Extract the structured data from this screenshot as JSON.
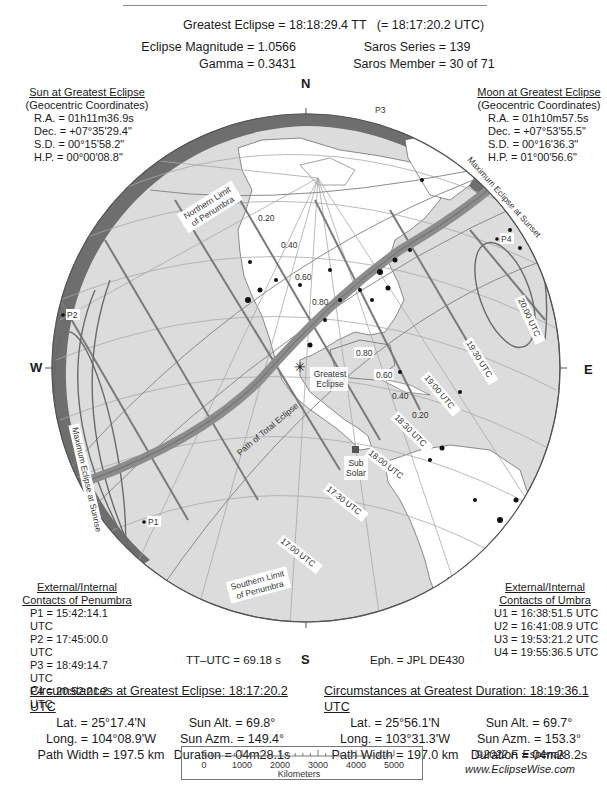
{
  "header": {
    "greatest_eclipse_label": "Greatest Eclipse =",
    "greatest_eclipse_tt": "18:18:29.4 TT",
    "greatest_eclipse_utc": "(= 18:17:20.2 UTC)",
    "magnitude_label": "Eclipse Magnitude =",
    "magnitude_value": "1.0566",
    "gamma_label": "Gamma =",
    "gamma_value": "0.3431",
    "saros_series_label": "Saros Series =",
    "saros_series_value": "139",
    "saros_member_label": "Saros Member =",
    "saros_member_value": "30 of 71"
  },
  "sun_panel": {
    "title": "Sun at Greatest Eclipse",
    "subtitle": "(Geocentric Coordinates)",
    "rows": [
      "R.A. = 01h11m36.9s",
      "Dec. = +07°35'29.4\"",
      "S.D. =  00°15'58.2\"",
      "H.P. =  00°00'08.8\""
    ]
  },
  "moon_panel": {
    "title": "Moon at Greatest Eclipse",
    "subtitle": "(Geocentric Coordinates)",
    "rows": [
      "R.A. = 01h10m57.5s",
      "Dec. = +07°53'55.5\"",
      "S.D. =  00°16'36.3\"",
      "H.P. =  01°00'56.6\""
    ]
  },
  "penumbra_contacts": {
    "title1": "External/Internal",
    "title2": "Contacts of Penumbra",
    "rows": [
      "P1 = 15:42:14.1 UTC",
      "P2 = 17:45:00.0 UTC",
      "P3 = 18:49:14.7 UTC",
      "P4 = 20:52:21.2 UTC"
    ]
  },
  "umbra_contacts": {
    "title1": "External/Internal",
    "title2": "Contacts of Umbra",
    "rows": [
      "U1 = 16:38:51.5 UTC",
      "U2 = 16:41:08.9 UTC",
      "U3 = 19:53:21.2 UTC",
      "U4 = 19:55:36.5 UTC"
    ]
  },
  "compass": {
    "n": "N",
    "s": "S",
    "e": "E",
    "w": "W"
  },
  "misc": {
    "tt_utc": "TT–UTC =  69.18 s",
    "ephemeris": "Eph. = JPL DE430"
  },
  "map": {
    "labels": {
      "northern_limit_1": "Northern Limit",
      "northern_limit_2": "of Penumbra",
      "southern_limit_1": "Southern Limit",
      "southern_limit_2": "of Penumbra",
      "max_sunset": "Maximum Eclipse at Sunset",
      "max_sunrise": "Maximum Eclipse at Sunrise",
      "path_total": "Path of Total Eclipse",
      "greatest_1": "Greatest",
      "greatest_2": "Eclipse",
      "subsolar_1": "Sub",
      "subsolar_2": "Solar",
      "p1": "P1",
      "p2": "P2",
      "p3": "P3",
      "p4": "P4"
    },
    "magnitude_labels": [
      "0.20",
      "0.40",
      "0.60",
      "0.80",
      "0.80",
      "0.60",
      "0.40",
      "0.20"
    ],
    "time_labels": [
      "17:00 UTC",
      "17:30 UTC",
      "18:00 UTC",
      "18:30 UTC",
      "19:00 UTC",
      "19:30 UTC",
      "20:00 UTC"
    ],
    "colors": {
      "ocean": "#dcdcdc",
      "land": "#ffffff",
      "night_band": "#6e6e6e",
      "path": "#8c8c8c",
      "grid": "#a8a8a8",
      "time_line": "#7a7a7a"
    }
  },
  "greatest_eclipse_circ": {
    "title": "Circumstances at Greatest Eclipse:  18:17:20.2 UTC",
    "lat": "Lat. =  25°17.4'N",
    "long": "Long. = 104°08.9'W",
    "path_width": "Path Width = 197.5 km",
    "sun_alt": "Sun Alt. =   69.8°",
    "sun_azm": "Sun Azm. = 149.4°",
    "duration": "Duration =  04m28.1s"
  },
  "greatest_duration_circ": {
    "title": "Circumstances at Greatest Duration:  18:19:36.1 UTC",
    "lat": "Lat. =  25°56.1'N",
    "long": "Long. = 103°31.3'W",
    "path_width": "Path Width = 197.0 km",
    "sun_alt": "Sun Alt. =   69.7°",
    "sun_azm": "Sun Azm. = 153.3°",
    "duration": "Duration =  04m28.2s"
  },
  "scale_bar": {
    "ticks": [
      "0",
      "1000",
      "2000",
      "3000",
      "4000",
      "5000"
    ],
    "unit": "Kilometers"
  },
  "credit": {
    "copyright": "©2022  F. Espenak",
    "website": "www.EclipseWise.com"
  }
}
